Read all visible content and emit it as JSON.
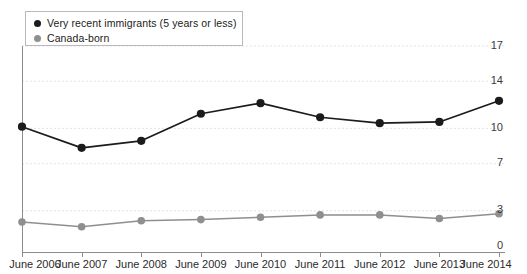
{
  "chart_data": {
    "type": "line",
    "title": "",
    "subtitle": "",
    "xlabel": "",
    "ylabel": "",
    "x": [
      "June 2006",
      "June 2007",
      "June 2008",
      "June 2009",
      "June 2010",
      "June 2011",
      "June 2012",
      "June 2013",
      "June 2014"
    ],
    "xtick_labels": [
      "June 2006",
      "June 2007",
      "June 2008",
      "June 2009",
      "June 2010",
      "June 2011",
      "June 2012",
      "June 2013",
      "June 2014"
    ],
    "ytick_labels": [
      "0",
      "3",
      "7",
      "10",
      "14",
      "17"
    ],
    "ytick_values": [
      0,
      3,
      7,
      10,
      14,
      17
    ],
    "ylim": [
      0,
      18.2
    ],
    "grid": true,
    "grid_axis": "y",
    "legend_position": "top-left",
    "series": [
      {
        "name": "Very recent immigrants (5 years or less)",
        "color": "#1b1b1b",
        "marker": "circle",
        "values": [
          10.1,
          8.3,
          8.9,
          11.2,
          12.1,
          10.9,
          10.4,
          10.5,
          12.3
        ]
      },
      {
        "name": "Canada-born",
        "color": "#8f8f8f",
        "marker": "circle",
        "values": [
          2.0,
          1.6,
          2.1,
          2.2,
          2.4,
          2.6,
          2.6,
          2.3,
          2.7
        ]
      }
    ]
  },
  "legend": {
    "entries": [
      {
        "label": "Very recent immigrants (5 years or less)",
        "color": "#1b1b1b"
      },
      {
        "label": "Canada-born",
        "color": "#8f8f8f"
      }
    ]
  },
  "axis": {
    "y_labels": [
      "17",
      "14",
      "10",
      "7",
      "3",
      "0"
    ],
    "x_labels": [
      "June 2006",
      "June 2007",
      "June 2008",
      "June 2009",
      "June 2010",
      "June 2011",
      "June 2012",
      "June 2013",
      "June 2014"
    ]
  },
  "colors": {
    "series_dark": "#1b1b1b",
    "series_gray": "#8f8f8f",
    "axis": "#8c8c8c",
    "grid": "#e8e2e2",
    "background": "#ffffff"
  }
}
